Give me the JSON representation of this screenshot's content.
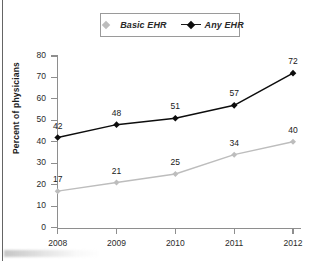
{
  "chart_data": {
    "type": "line",
    "title": "",
    "xlabel": "",
    "ylabel": "Percent of physicians",
    "categories": [
      "2008",
      "2009",
      "2010",
      "2011",
      "2012"
    ],
    "x": [
      2008,
      2009,
      2010,
      2011,
      2012
    ],
    "ylim": [
      0,
      80
    ],
    "yticks": [
      0,
      10,
      20,
      30,
      40,
      50,
      60,
      70,
      80
    ],
    "grid": false,
    "legend_position": "top-center",
    "series": [
      {
        "name": "Basic EHR",
        "color": "#bdbdbd",
        "marker": "diamond",
        "values": [
          17,
          21,
          25,
          34,
          40
        ],
        "labels": [
          "17",
          "21",
          "25",
          "34",
          "40"
        ]
      },
      {
        "name": "Any EHR",
        "color": "#0d0d0d",
        "marker": "diamond",
        "values": [
          42,
          48,
          51,
          57,
          72
        ],
        "labels": [
          "42",
          "48",
          "51",
          "57",
          "72"
        ]
      }
    ]
  },
  "legend": {
    "items": [
      {
        "label": "Basic EHR",
        "icon": "diamond-marker-icon"
      },
      {
        "label": "Any EHR",
        "icon": "diamond-marker-line-icon"
      }
    ]
  },
  "axes": {
    "y_title": "Percent of physicians",
    "y_tick_labels": [
      "80",
      "70",
      "60",
      "50",
      "40",
      "30",
      "20",
      "10",
      "0"
    ],
    "x_tick_labels": [
      "2008",
      "2009",
      "2010",
      "2011",
      "2012"
    ]
  }
}
